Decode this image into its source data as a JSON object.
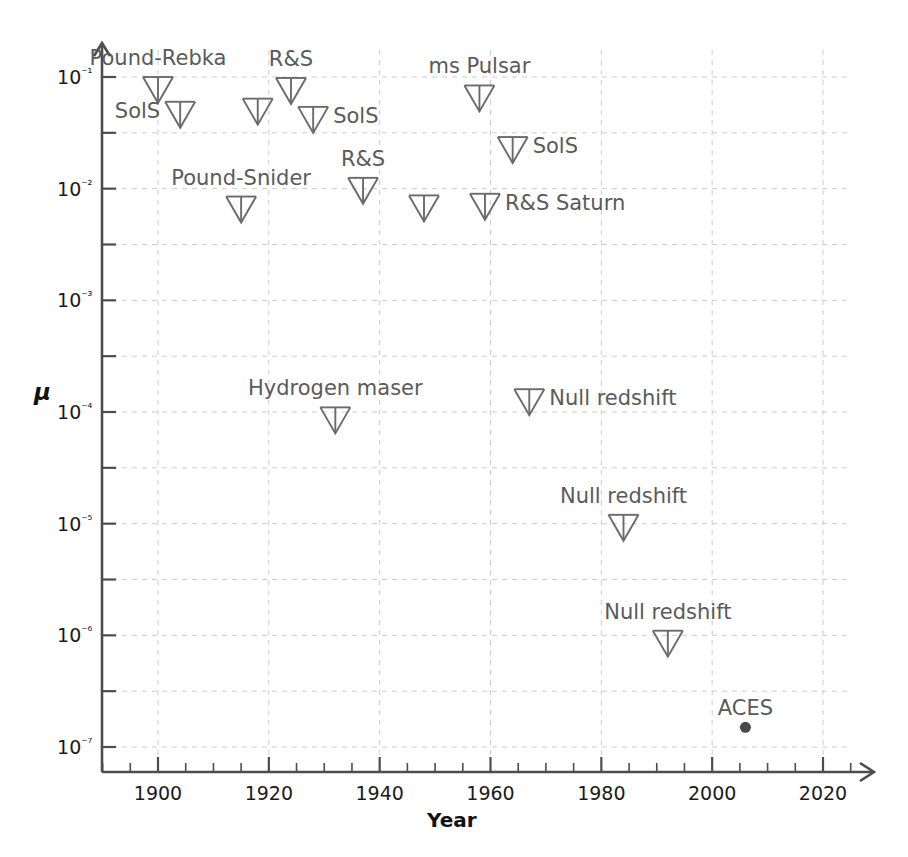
{
  "chart_data": {
    "type": "scatter",
    "title": "",
    "xlabel": "Year",
    "ylabel": "μ",
    "xlim": [
      1890,
      2027
    ],
    "ylim": [
      1e-07,
      0.16
    ],
    "yscale": "log",
    "grid": true,
    "legend": null,
    "x_major_ticks": [
      1900,
      1920,
      1940,
      1960,
      1980,
      2000,
      2020
    ],
    "x_major_tick_labels": [
      "1900",
      "1920",
      "1940",
      "1960",
      "1980",
      "2000",
      "2020"
    ],
    "x_minor_tick_step": 5,
    "y_major_ticks": [
      0.1,
      0.01,
      0.001,
      0.0001,
      1e-05,
      1e-06,
      1e-07
    ],
    "y_major_tick_labels": [
      "10⁻¹",
      "10⁻²",
      "10⁻³",
      "10⁻⁴",
      "10⁻⁵",
      "10⁻⁶",
      "10⁻⁷"
    ],
    "y_minor_ticks_per_decade": 1,
    "marker_upper_limit": "down-arrow-with-cap",
    "marker_measurement": "filled-circle",
    "points": [
      {
        "id": "pound-rebka",
        "label": "Pound-Rebka",
        "year": 1900,
        "mu": 0.1,
        "kind": "upper-limit",
        "label_pos": "above-center"
      },
      {
        "id": "sols-1",
        "label": "SolS",
        "year": 1904,
        "mu": 0.06,
        "kind": "upper-limit",
        "label_pos": "left"
      },
      {
        "id": "pound-snider",
        "label": "Pound-Snider",
        "year": 1915,
        "mu": 0.0085,
        "kind": "upper-limit",
        "label_pos": "above-center"
      },
      {
        "id": "unlabeled-1918",
        "label": "",
        "year": 1918,
        "mu": 0.064,
        "kind": "upper-limit",
        "label_pos": "none"
      },
      {
        "id": "rs-1",
        "label": "R&S",
        "year": 1924,
        "mu": 0.098,
        "kind": "upper-limit",
        "label_pos": "above-center"
      },
      {
        "id": "sols-2",
        "label": "SolS",
        "year": 1928,
        "mu": 0.054,
        "kind": "upper-limit",
        "label_pos": "right"
      },
      {
        "id": "hydrogen-maser",
        "label": "Hydrogen maser",
        "year": 1932,
        "mu": 0.00011,
        "kind": "upper-limit",
        "label_pos": "above-center"
      },
      {
        "id": "rs-2",
        "label": "R&S",
        "year": 1937,
        "mu": 0.0125,
        "kind": "upper-limit",
        "label_pos": "above-center"
      },
      {
        "id": "unlabeled-1948",
        "label": "",
        "year": 1948,
        "mu": 0.0087,
        "kind": "upper-limit",
        "label_pos": "none"
      },
      {
        "id": "ms-pulsar",
        "label": "ms Pulsar",
        "year": 1958,
        "mu": 0.084,
        "kind": "upper-limit",
        "label_pos": "above-center"
      },
      {
        "id": "rs-saturn",
        "label": "R&S Saturn",
        "year": 1959,
        "mu": 0.009,
        "kind": "upper-limit",
        "label_pos": "right"
      },
      {
        "id": "sols-3",
        "label": "SolS",
        "year": 1964,
        "mu": 0.029,
        "kind": "upper-limit",
        "label_pos": "right"
      },
      {
        "id": "null-redshift-1",
        "label": "Null redshift",
        "year": 1967,
        "mu": 0.00016,
        "kind": "upper-limit",
        "label_pos": "right"
      },
      {
        "id": "null-redshift-2",
        "label": "Null redshift",
        "year": 1984,
        "mu": 1.2e-05,
        "kind": "upper-limit",
        "label_pos": "above-center"
      },
      {
        "id": "null-redshift-3",
        "label": "Null redshift",
        "year": 1992,
        "mu": 1.1e-06,
        "kind": "upper-limit",
        "label_pos": "above-center"
      },
      {
        "id": "aces",
        "label": "ACES",
        "year": 2006,
        "mu": 1.5e-07,
        "kind": "measurement",
        "label_pos": "above-center"
      }
    ]
  },
  "axes": {
    "x_title": "Year",
    "y_title": "μ"
  },
  "style": {
    "axis_color": "#4d4d4d",
    "grid_color": "#cccccc",
    "marker_color": "#6b6b6b",
    "label_color": "#5a5a5a",
    "tick_label_color": "#1a1a1a"
  }
}
